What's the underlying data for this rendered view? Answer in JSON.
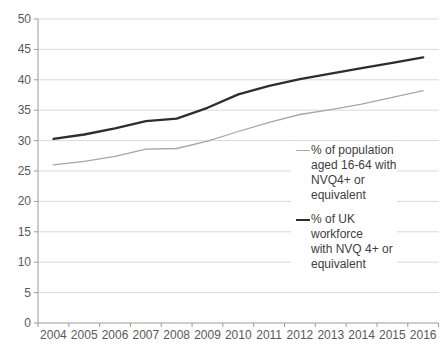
{
  "chart_data": {
    "type": "line",
    "title": "",
    "xlabel": "",
    "ylabel": "",
    "categories": [
      "2004",
      "2005",
      "2006",
      "2007",
      "2008",
      "2009",
      "2010",
      "2011",
      "2012",
      "2013",
      "2014",
      "2015",
      "2016"
    ],
    "yticks": [
      0,
      5,
      10,
      15,
      20,
      25,
      30,
      35,
      40,
      45,
      50
    ],
    "ylim": [
      0,
      50
    ],
    "grid": "horizontal",
    "legend_position": "inside-right",
    "series": [
      {
        "name": "% of population aged 16-64 with NVQ4+ or equivalent",
        "label_wrapped": "% of population\naged 16-64 with\nNVQ4+ or\nequivalent",
        "color": "#a6a6a6",
        "stroke_width": 1.3,
        "values": [
          26.0,
          26.6,
          27.4,
          28.6,
          28.7,
          29.9,
          31.5,
          33.0,
          34.3,
          35.1,
          36.0,
          37.1,
          38.2
        ]
      },
      {
        "name": "% of UK workforce with NVQ 4+ or equivalent",
        "label_wrapped": "% of UK workforce\nwith NVQ 4+ or\nequivalent",
        "color": "#2e2e2e",
        "stroke_width": 2.3,
        "values": [
          30.3,
          31.0,
          32.0,
          33.2,
          33.6,
          35.4,
          37.6,
          39.0,
          40.1,
          41.0,
          41.9,
          42.8,
          43.7
        ]
      }
    ],
    "colors": {
      "background": "#ffffff",
      "gridline": "#d9d9d9",
      "axis_line": "#9b9b9b",
      "tick_label": "#595959",
      "legend_text": "#404040"
    }
  }
}
